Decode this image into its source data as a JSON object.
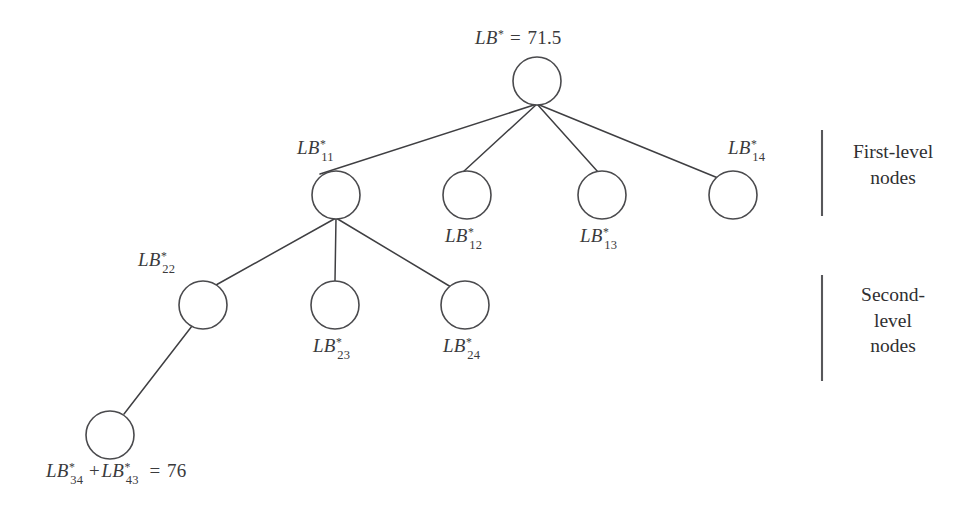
{
  "diagram": {
    "type": "branch-and-bound-tree",
    "background_color": "#ffffff",
    "stroke_color": "#3f3f42",
    "text_color": "#3a3a3c",
    "root": {
      "id": "root",
      "label_prefix": "LB",
      "label_star": "*",
      "label_equals": " = ",
      "value": "71.5",
      "cx": 537,
      "cy": 81,
      "r": 24
    },
    "first_level": [
      {
        "id": "n11",
        "prefix": "LB",
        "star": "*",
        "sub": "11",
        "cx": 336,
        "cy": 195,
        "r": 24
      },
      {
        "id": "n12",
        "prefix": "LB",
        "star": "*",
        "sub": "12",
        "cx": 467,
        "cy": 195,
        "r": 24
      },
      {
        "id": "n13",
        "prefix": "LB",
        "star": "*",
        "sub": "13",
        "cx": 602,
        "cy": 195,
        "r": 24
      },
      {
        "id": "n14",
        "prefix": "LB",
        "star": "*",
        "sub": "14",
        "cx": 733,
        "cy": 195,
        "r": 24
      }
    ],
    "second_level": [
      {
        "id": "n22",
        "prefix": "LB",
        "star": "*",
        "sub": "22",
        "cx": 203,
        "cy": 305,
        "r": 24
      },
      {
        "id": "n23",
        "prefix": "LB",
        "star": "*",
        "sub": "23",
        "cx": 335,
        "cy": 305,
        "r": 24
      },
      {
        "id": "n24",
        "prefix": "LB",
        "star": "*",
        "sub": "24",
        "cx": 465,
        "cy": 305,
        "r": 24
      }
    ],
    "deep_node": {
      "id": "n34_43",
      "prefix_a": "LB",
      "star_a": "*",
      "sub_a": "34",
      "operator": "+",
      "prefix_b": "LB",
      "star_b": "*",
      "sub_b": "43",
      "equals": " = ",
      "value": "76",
      "cx": 110,
      "cy": 435,
      "r": 24
    },
    "annotations": [
      {
        "id": "first-level",
        "text": "First-level\nnodes",
        "bracket_x": 822,
        "bracket_y1": 130,
        "bracket_y2": 216,
        "text_x": 838,
        "text_y": 139
      },
      {
        "id": "second-level",
        "text": "Second-\nlevel\nnodes",
        "bracket_x": 822,
        "bracket_y1": 275,
        "bracket_y2": 381,
        "text_x": 838,
        "text_y": 282
      }
    ]
  }
}
